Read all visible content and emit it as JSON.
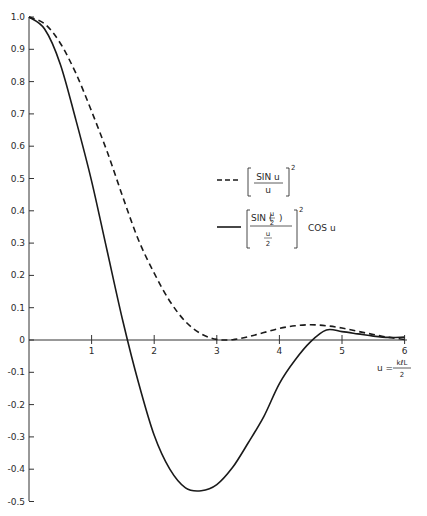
{
  "chart_data": {
    "type": "line",
    "title": "",
    "xlabel": "u = kℓL/2",
    "xlabel_parts": {
      "lhs": "u =",
      "numerator": "kℓL",
      "denominator": "2"
    },
    "ylabel": "",
    "xlim": [
      0,
      6
    ],
    "ylim": [
      -0.5,
      1.0
    ],
    "grid": false,
    "x_ticks": [
      1,
      2,
      3,
      4,
      5,
      6
    ],
    "x_tick_labels": [
      "1",
      "2",
      "3",
      "4",
      "5",
      "6"
    ],
    "y_ticks": [
      1.0,
      0.9,
      0.8,
      0.7,
      0.6,
      0.5,
      0.4,
      0.3,
      0.2,
      0.1,
      0,
      -0.1,
      -0.2,
      -0.3,
      -0.4,
      -0.5
    ],
    "y_tick_labels": [
      "1.0",
      "0.9",
      "0.8",
      "0.7",
      "0.6",
      "0.5",
      "0.4",
      "0.3",
      "0.2",
      "0.1",
      "0",
      "-0.1",
      "-0.2",
      "-0.3",
      "-0.4",
      "-0.5"
    ],
    "legend_position": "right-middle",
    "x": [
      0,
      0.25,
      0.5,
      0.75,
      1.0,
      1.25,
      1.5,
      1.75,
      2.0,
      2.25,
      2.5,
      2.75,
      3.0,
      3.25,
      3.5,
      3.75,
      4.0,
      4.25,
      4.5,
      4.75,
      5.0,
      5.25,
      5.5,
      5.75,
      6.0
    ],
    "series": [
      {
        "name": "[SIN u / u]^2",
        "style": "dashed",
        "color": "#1a1a1a",
        "values": [
          1.0,
          0.979,
          0.919,
          0.825,
          0.708,
          0.582,
          0.442,
          0.309,
          0.207,
          0.12,
          0.057,
          0.019,
          0.002,
          0.001,
          0.01,
          0.023,
          0.036,
          0.044,
          0.047,
          0.044,
          0.037,
          0.027,
          0.017,
          0.008,
          0.002
        ]
      },
      {
        "name": "[SIN(u/2) / (u/2)]^2 COS u",
        "style": "solid",
        "color": "#1a1a1a",
        "values": [
          1.0,
          0.963,
          0.854,
          0.68,
          0.492,
          0.274,
          0.058,
          -0.133,
          -0.295,
          -0.4,
          -0.458,
          -0.467,
          -0.448,
          -0.395,
          -0.319,
          -0.237,
          -0.135,
          -0.062,
          -0.005,
          0.031,
          0.026,
          0.019,
          0.012,
          0.008,
          0.009
        ]
      }
    ]
  },
  "legend": {
    "dashed": {
      "numerator": "SIN u",
      "denominator": "u",
      "exponent": "2"
    },
    "solid": {
      "numerator": "SIN (",
      "numerator_frac_num": "u",
      "numerator_frac_den": "2",
      "numerator_close": ")",
      "denominator_num": "u",
      "denominator_den": "2",
      "exponent": "2",
      "suffix": "COS u"
    }
  }
}
